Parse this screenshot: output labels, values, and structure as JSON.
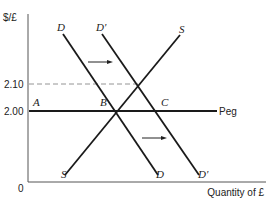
{
  "diagram": {
    "y_axis_label": "$/£",
    "x_axis_label": "Quantity of £",
    "origin_label": "0",
    "y_ticks": [
      {
        "label": "2.10",
        "y": 84
      },
      {
        "label": "2.00",
        "y": 111
      }
    ],
    "peg_label": "Peg",
    "curves": [
      {
        "label": "D",
        "label_bottom": "D",
        "kind": "demand",
        "from": [
          63,
          34
        ],
        "to": [
          158,
          175
        ]
      },
      {
        "label": "D'",
        "label_bottom": "D'",
        "kind": "shifted demand",
        "from": [
          102,
          34
        ],
        "to": [
          199,
          175
        ]
      },
      {
        "label": "S",
        "label_bottom": "S",
        "kind": "supply",
        "from": [
          65,
          175
        ],
        "to": [
          180,
          35
        ]
      }
    ],
    "points": [
      {
        "label": "A",
        "x": 36,
        "y": 104
      },
      {
        "label": "B",
        "x": 103,
        "y": 104
      },
      {
        "label": "C",
        "x": 163,
        "y": 104
      }
    ],
    "arrows": [
      {
        "direction": "right",
        "from": [
          88,
          62
        ],
        "to": [
          113,
          62
        ]
      },
      {
        "direction": "right",
        "from": [
          142,
          138
        ],
        "to": [
          167,
          138
        ]
      }
    ],
    "colors": {
      "line": "#1a1a1a",
      "axis": "#555555",
      "dash": "#888888",
      "background": "#ffffff"
    }
  }
}
